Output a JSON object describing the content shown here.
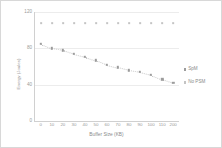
{
  "chart_data": {
    "type": "scatter",
    "title": "",
    "xlabel": "Buffer Size (KB)",
    "ylabel": "Energy (Joules)",
    "xlim": [
      0,
      13
    ],
    "ylim": [
      0,
      120
    ],
    "yticks": [
      0,
      40,
      80,
      120
    ],
    "grid": true,
    "legend_position": "right",
    "categories": [
      "0",
      "10",
      "20",
      "30",
      "40",
      "50",
      "60",
      "70",
      "80",
      "90",
      "100",
      "110",
      "200"
    ],
    "series": [
      {
        "name": "SpM",
        "color": "#9c9c9c",
        "values": [
          85,
          80,
          78,
          74,
          71,
          67,
          62,
          59,
          56,
          54,
          51,
          46,
          42
        ]
      },
      {
        "name": "No PSM",
        "color": "#c4c4c4",
        "values": [
          108,
          108,
          108,
          108,
          108,
          108,
          108,
          108,
          108,
          108,
          108,
          108,
          108
        ]
      }
    ]
  },
  "axis": {
    "y_tick_labels": [
      "120",
      "80",
      "40",
      "0"
    ],
    "x_tick_labels": [
      "0",
      "10",
      "20",
      "30",
      "40",
      "50",
      "60",
      "70",
      "80",
      "90",
      "100",
      "110",
      "200"
    ],
    "x_title": "Buffer Size (KB)",
    "y_title": "Energy (Joules)"
  },
  "legend": {
    "items": [
      {
        "label": "SpM"
      },
      {
        "label": "No PSM"
      }
    ]
  }
}
